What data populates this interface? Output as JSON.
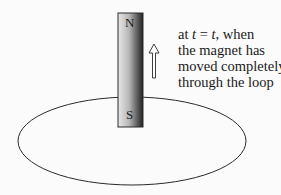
{
  "diagram": {
    "magnet": {
      "north_label": "N",
      "south_label": "S",
      "motion": "upward"
    },
    "loop": {
      "shape": "ellipse"
    },
    "arrow": {
      "direction": "up"
    },
    "caption": {
      "line1_prefix": "at ",
      "line1_var1": "t",
      "line1_eq": " = ",
      "line1_var2": "t",
      "line1_suffix": ", when",
      "line2": "the magnet has",
      "line3": "moved completely",
      "line4": "through the loop"
    },
    "colors": {
      "background": "#fbfbfb",
      "stroke": "#2a2a2a",
      "magnet_light": "#e6e6e6",
      "magnet_dark": "#2b2b2b"
    }
  }
}
